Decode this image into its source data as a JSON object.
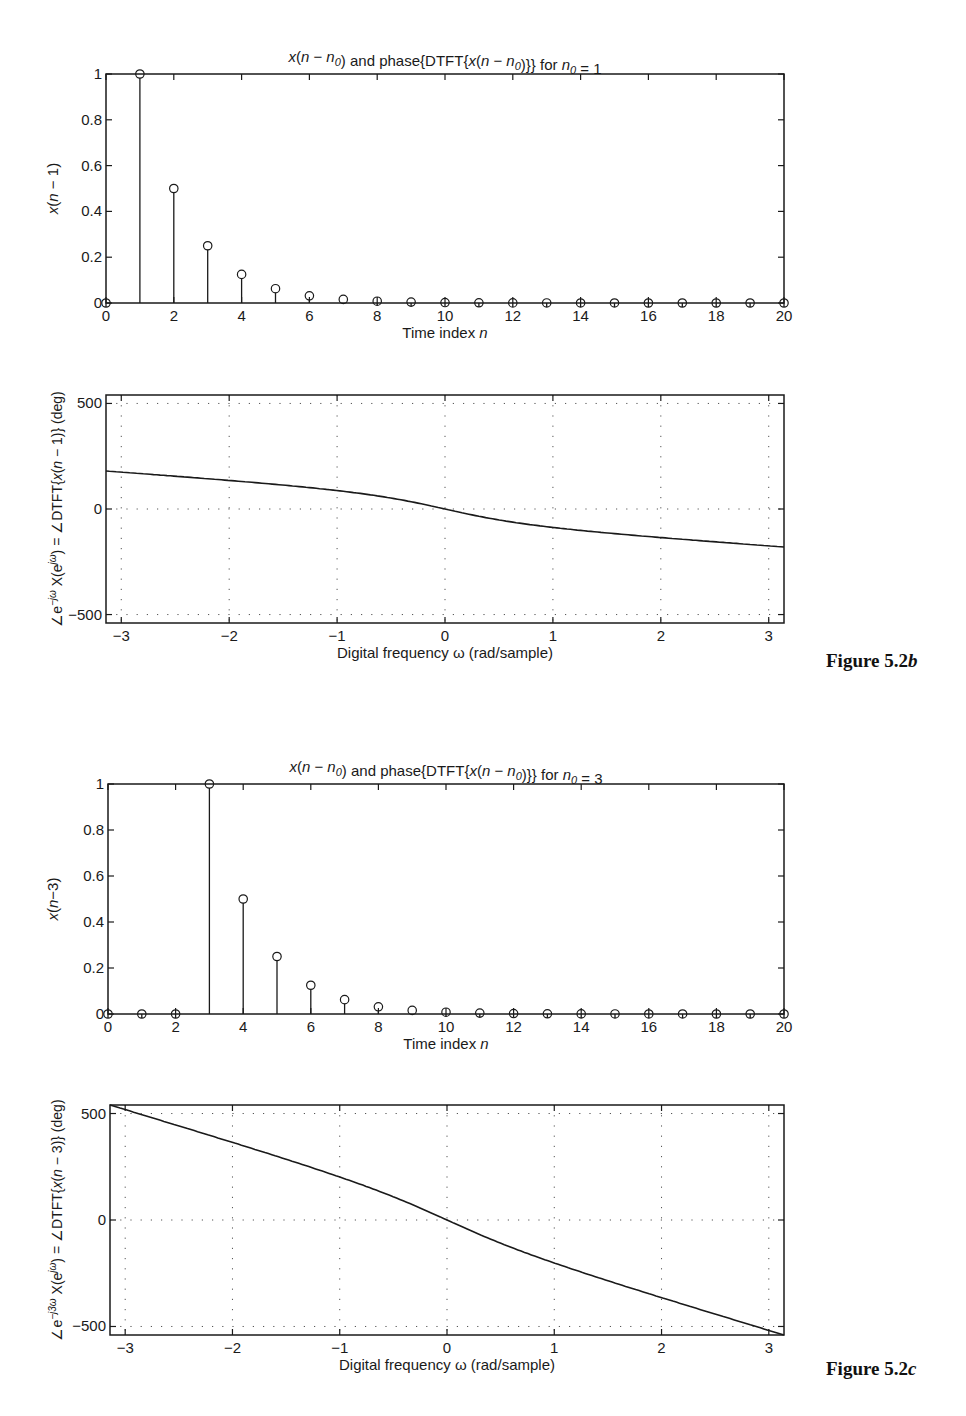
{
  "figures": [
    {
      "label": "Figure 5.2b",
      "label_prefix": "Figure 5.2",
      "label_suffix": "b",
      "title": "x(n − n0) and phase{DTFT{x(n − n0)}} for n0 = 1"
    },
    {
      "label": "Figure 5.2c",
      "label_prefix": "Figure 5.2",
      "label_suffix": "c",
      "title": "x(n − n0) and phase{DTFT{x(n − n0)}} for n0 = 3"
    }
  ],
  "chart_data": [
    {
      "id": "stem_n0_1",
      "type": "scatter",
      "style": "stem",
      "title": "x(n − n0) and phase{DTFT{x(n − n0)}} for n0 = 1",
      "xlabel": "Time index n",
      "ylabel": "x(n − 1)",
      "xlim": [
        0,
        20
      ],
      "ylim": [
        0,
        1
      ],
      "xticks": [
        0,
        2,
        4,
        6,
        8,
        10,
        12,
        14,
        16,
        18,
        20
      ],
      "yticks": [
        0,
        0.2,
        0.4,
        0.6,
        0.8,
        1
      ],
      "grid": false,
      "x": [
        0,
        1,
        2,
        3,
        4,
        5,
        6,
        7,
        8,
        9,
        10,
        11,
        12,
        13,
        14,
        15,
        16,
        17,
        18,
        19,
        20
      ],
      "values": [
        0,
        1,
        0.5,
        0.25,
        0.125,
        0.0625,
        0.03125,
        0.015625,
        0.0078,
        0.0039,
        0.002,
        0.001,
        0.0005,
        0.0002,
        0.0001,
        0.0001,
        0,
        0,
        0,
        0,
        0
      ]
    },
    {
      "id": "phase_n0_1",
      "type": "line",
      "xlabel": "Digital frequency ω (rad/sample)",
      "ylabel": "∠e^(−jω) X(e^(jω)) = ∠DTFT{x(n − 1)} (deg)",
      "xlim": [
        -3.1416,
        3.1416
      ],
      "ylim": [
        -540,
        540
      ],
      "xticks": [
        -3,
        -2,
        -1,
        0,
        1,
        2,
        3
      ],
      "yticks": [
        -500,
        0,
        500
      ],
      "grid": true,
      "x": [
        -3.1416,
        -2.7489,
        -2.3562,
        -1.9635,
        -1.5708,
        -1.1781,
        -0.7854,
        -0.3927,
        0,
        0.3927,
        0.7854,
        1.1781,
        1.5708,
        1.9635,
        2.3562,
        2.7489,
        3.1416
      ],
      "values": [
        180,
        164.96,
        149.64,
        133.69,
        116.57,
        97.23,
        73.68,
        42.07,
        0,
        -42.07,
        -73.68,
        -97.23,
        -116.57,
        -133.69,
        -149.64,
        -164.96,
        -180
      ]
    },
    {
      "id": "stem_n0_3",
      "type": "scatter",
      "style": "stem",
      "title": "x(n − n0) and phase{DTFT{x(n − n0)}} for n0 = 3",
      "xlabel": "Time index n",
      "ylabel": "x(n−3)",
      "xlim": [
        0,
        20
      ],
      "ylim": [
        0,
        1
      ],
      "xticks": [
        0,
        2,
        4,
        6,
        8,
        10,
        12,
        14,
        16,
        18,
        20
      ],
      "yticks": [
        0,
        0.2,
        0.4,
        0.6,
        0.8,
        1
      ],
      "grid": false,
      "x": [
        0,
        1,
        2,
        3,
        4,
        5,
        6,
        7,
        8,
        9,
        10,
        11,
        12,
        13,
        14,
        15,
        16,
        17,
        18,
        19,
        20
      ],
      "values": [
        0,
        0,
        0,
        1,
        0.5,
        0.25,
        0.125,
        0.0625,
        0.03125,
        0.015625,
        0.0078,
        0.0039,
        0.002,
        0.001,
        0.0005,
        0.0002,
        0.0001,
        0.0001,
        0,
        0,
        0
      ]
    },
    {
      "id": "phase_n0_3",
      "type": "line",
      "xlabel": "Digital frequency ω (rad/sample)",
      "ylabel": "∠e^(−j3ω) X(e^(jω)) = ∠DTFT{x(n − 3)} (deg)",
      "xlim": [
        -3.1416,
        3.1416
      ],
      "ylim": [
        -540,
        540
      ],
      "xticks": [
        -3,
        -2,
        -1,
        0,
        1,
        2,
        3
      ],
      "yticks": [
        -500,
        0,
        500
      ],
      "grid": true,
      "x": [
        -3.1416,
        -2.7489,
        -2.3562,
        -1.9635,
        -1.5708,
        -1.1781,
        -0.7854,
        -0.3927,
        0,
        0.3927,
        0.7854,
        1.1781,
        1.5708,
        1.9635,
        2.3562,
        2.7489,
        3.1416
      ],
      "values": [
        540,
        479.96,
        419.64,
        358.69,
        296.57,
        232.23,
        163.68,
        87.07,
        0,
        -87.07,
        -163.68,
        -232.23,
        -296.57,
        -358.69,
        -419.64,
        -479.96,
        -540
      ]
    }
  ],
  "layout": {
    "plots": [
      {
        "left": 106,
        "top": 74,
        "right": 784,
        "bottom": 303
      },
      {
        "left": 106,
        "top": 395,
        "right": 784,
        "bottom": 623
      },
      {
        "left": 108,
        "top": 784,
        "right": 784,
        "bottom": 1014
      },
      {
        "left": 110,
        "top": 1105,
        "right": 784,
        "bottom": 1335
      }
    ]
  }
}
